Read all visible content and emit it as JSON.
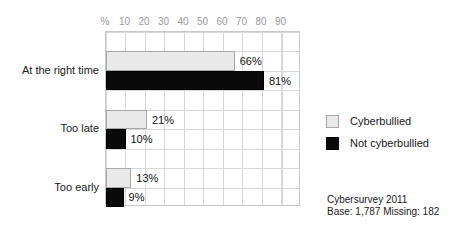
{
  "chart_data": {
    "type": "bar",
    "orientation": "horizontal",
    "title": "",
    "xlabel": "%",
    "ylabel": "",
    "xlim": [
      0,
      100
    ],
    "grid": true,
    "legend_position": "right",
    "categories": [
      "At the right time",
      "Too late",
      "Too early"
    ],
    "tick_labels": [
      "%",
      "10",
      "20",
      "30",
      "40",
      "50",
      "60",
      "70",
      "80",
      "90"
    ],
    "tick_values": [
      0,
      10,
      20,
      30,
      40,
      50,
      60,
      70,
      80,
      90
    ],
    "series": [
      {
        "name": "Cyberbullied",
        "color": "#e9e9e9",
        "values": [
          66,
          21,
          13
        ],
        "data_labels": [
          "66%",
          "21%",
          "13%"
        ]
      },
      {
        "name": "Not cyberbullied",
        "color": "#0a0a0a",
        "values": [
          81,
          10,
          9
        ],
        "data_labels": [
          "81%",
          "10%",
          "9%"
        ]
      }
    ]
  },
  "legend": {
    "items": [
      {
        "label": "Cyberbullied",
        "swatch": "light"
      },
      {
        "label": "Not cyberbullied",
        "swatch": "dark"
      }
    ]
  },
  "source_note": {
    "line1": "Cybersurvey 2011",
    "line2": "Base: 1,787  Missing: 182"
  }
}
